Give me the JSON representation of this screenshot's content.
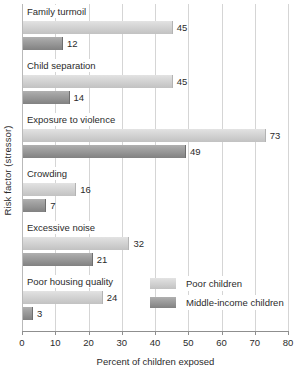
{
  "chart_data": {
    "type": "bar",
    "orientation": "horizontal",
    "title": "",
    "xlabel": "Percent of children exposed",
    "ylabel": "Risk factor (stressor)",
    "xlim": [
      0,
      80
    ],
    "xticks": [
      0,
      10,
      20,
      30,
      40,
      50,
      60,
      70,
      80
    ],
    "grid": true,
    "legend_position": "inside-lower-right",
    "categories": [
      "Family turmoil",
      "Child separation",
      "Exposure to violence",
      "Crowding",
      "Excessive noise",
      "Poor housing quality"
    ],
    "series": [
      {
        "name": "Poor children",
        "color": "#cfcfcf",
        "values": [
          45,
          45,
          73,
          16,
          32,
          24
        ]
      },
      {
        "name": "Middle-income children",
        "color": "#949494",
        "values": [
          12,
          14,
          49,
          7,
          21,
          3
        ]
      }
    ]
  },
  "colors": {
    "series_light": "#cfcfcf",
    "series_dark": "#949494",
    "gridline": "#d5d5d5",
    "axis": "#8f8f8f",
    "text": "#2b2b2b",
    "background": "#ffffff"
  }
}
